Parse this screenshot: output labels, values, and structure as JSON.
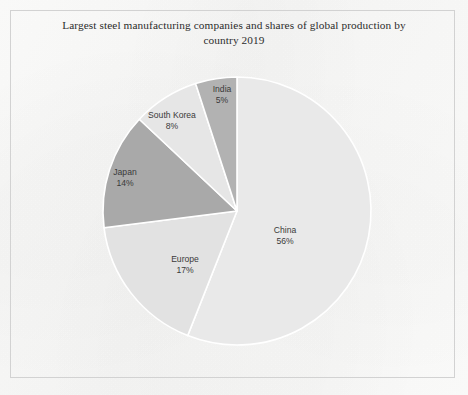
{
  "chart_data": {
    "type": "pie",
    "title": "Largest steel manufacturing companies and shares of global production by country 2019",
    "xlabel": "",
    "ylabel": "",
    "legend": "none",
    "grid": false,
    "units": "percent of global production",
    "categories": [
      "China",
      "Europe",
      "Japan",
      "South Korea",
      "India"
    ],
    "values": [
      56,
      17,
      14,
      8,
      5
    ],
    "slices": [
      {
        "label": "China",
        "value": 56,
        "value_text": "56%",
        "color": "#e9e9e9",
        "start_angle": 0,
        "end_angle": 201.6,
        "label_x": 285,
        "label_y": 236
      },
      {
        "label": "Europe",
        "value": 17,
        "value_text": "17%",
        "color": "#e2e2e2",
        "start_angle": 201.6,
        "end_angle": 262.8,
        "label_x": 185,
        "label_y": 265
      },
      {
        "label": "Japan",
        "value": 14,
        "value_text": "14%",
        "color": "#a9a9a9",
        "start_angle": 262.8,
        "end_angle": 313.2,
        "label_x": 125,
        "label_y": 178
      },
      {
        "label": "South Korea",
        "value": 8,
        "value_text": "8%",
        "color": "#e6e6e6",
        "start_angle": 313.2,
        "end_angle": 342.0,
        "label_x": 172,
        "label_y": 121
      },
      {
        "label": "India",
        "value": 5,
        "value_text": "5%",
        "color": "#b2b2b2",
        "start_angle": 342.0,
        "end_angle": 360.0,
        "label_x": 222,
        "label_y": 95
      }
    ],
    "geometry": {
      "center_x": 237,
      "center_y": 211,
      "radius": 134,
      "separator_color": "#ffffff",
      "separator_width": 1.6
    }
  },
  "page": {
    "background_color": "#fbfbfa",
    "frame_color": "#d2d2d2"
  }
}
